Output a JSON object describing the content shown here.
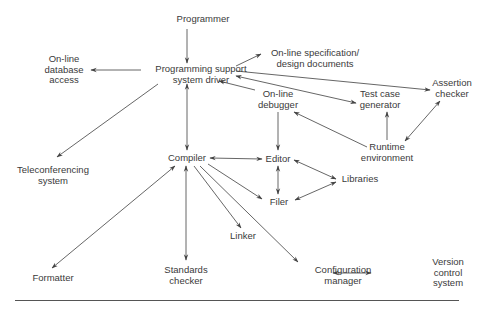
{
  "diagram": {
    "type": "programming-support-environment",
    "nodes": [
      {
        "id": "programmer",
        "label": "Programmer",
        "x": 203,
        "y": 19
      },
      {
        "id": "pssd",
        "label": "Programming support\nsystem driver",
        "x": 201,
        "y": 74
      },
      {
        "id": "db",
        "label": "On-line\ndatabase\naccess",
        "x": 64,
        "y": 70
      },
      {
        "id": "spec",
        "label": "On-line specification/\ndesign documents",
        "x": 315,
        "y": 58
      },
      {
        "id": "debugger",
        "label": "On-line\ndebugger",
        "x": 278,
        "y": 99
      },
      {
        "id": "testgen",
        "label": "Test case\ngenerator",
        "x": 380,
        "y": 99
      },
      {
        "id": "assert",
        "label": "Assertion\nchecker",
        "x": 452,
        "y": 88
      },
      {
        "id": "runtime",
        "label": "Runtime\nenvironment",
        "x": 387,
        "y": 152
      },
      {
        "id": "telecon",
        "label": "Teleconferencing\nsystem",
        "x": 53,
        "y": 175
      },
      {
        "id": "compiler",
        "label": "Compiler",
        "x": 187,
        "y": 158
      },
      {
        "id": "editor",
        "label": "Editor",
        "x": 278,
        "y": 159
      },
      {
        "id": "libraries",
        "label": "Libraries",
        "x": 360,
        "y": 179
      },
      {
        "id": "filer",
        "label": "Filer",
        "x": 279,
        "y": 202
      },
      {
        "id": "linker",
        "label": "Linker",
        "x": 243,
        "y": 236
      },
      {
        "id": "formatter",
        "label": "Formatter",
        "x": 53,
        "y": 278
      },
      {
        "id": "standards",
        "label": "Standards\nchecker",
        "x": 186,
        "y": 275
      },
      {
        "id": "config",
        "label": "Configuration\nmanager",
        "x": 343,
        "y": 275
      },
      {
        "id": "version",
        "label": "Version\ncontrol\nsystem",
        "x": 448,
        "y": 273
      }
    ],
    "edges": [
      {
        "from": "programmer",
        "to": "pssd",
        "dir": "forward",
        "x1": 187,
        "y1": 29,
        "x2": 187,
        "y2": 63
      },
      {
        "from": "pssd",
        "to": "db",
        "dir": "forward",
        "x1": 141,
        "y1": 70,
        "x2": 91,
        "y2": 70
      },
      {
        "from": "pssd",
        "to": "spec",
        "dir": "forward",
        "x1": 236,
        "y1": 66,
        "x2": 261,
        "y2": 54
      },
      {
        "from": "pssd",
        "to": "assert",
        "dir": "forward",
        "x1": 236,
        "y1": 71,
        "x2": 430,
        "y2": 90
      },
      {
        "from": "pssd",
        "to": "testgen",
        "dir": "both",
        "x1": 236,
        "y1": 76,
        "x2": 356,
        "y2": 103
      },
      {
        "from": "debugger",
        "to": "pssd",
        "dir": "forward",
        "x1": 255,
        "y1": 90,
        "x2": 219,
        "y2": 81
      },
      {
        "from": "pssd",
        "to": "telecon",
        "dir": "forward",
        "x1": 158,
        "y1": 84,
        "x2": 57,
        "y2": 157
      },
      {
        "from": "pssd",
        "to": "compiler",
        "dir": "both",
        "x1": 187,
        "y1": 84,
        "x2": 187,
        "y2": 150
      },
      {
        "from": "debugger",
        "to": "editor",
        "dir": "forward",
        "x1": 278,
        "y1": 112,
        "x2": 278,
        "y2": 150
      },
      {
        "from": "runtime",
        "to": "debugger",
        "dir": "forward",
        "x1": 367,
        "y1": 147,
        "x2": 294,
        "y2": 112
      },
      {
        "from": "runtime",
        "to": "testgen",
        "dir": "forward",
        "x1": 387,
        "y1": 140,
        "x2": 387,
        "y2": 112
      },
      {
        "from": "runtime",
        "to": "assert",
        "dir": "both",
        "x1": 405,
        "y1": 141,
        "x2": 440,
        "y2": 101
      },
      {
        "from": "compiler",
        "to": "editor",
        "dir": "both",
        "x1": 210,
        "y1": 158,
        "x2": 262,
        "y2": 159
      },
      {
        "from": "editor",
        "to": "filer",
        "dir": "both",
        "x1": 278,
        "y1": 166,
        "x2": 278,
        "y2": 194
      },
      {
        "from": "editor",
        "to": "libraries",
        "dir": "both",
        "x1": 294,
        "y1": 160,
        "x2": 336,
        "y2": 179
      },
      {
        "from": "filer",
        "to": "libraries",
        "dir": "both",
        "x1": 295,
        "y1": 200,
        "x2": 336,
        "y2": 182
      },
      {
        "from": "compiler",
        "to": "filer",
        "dir": "forward",
        "x1": 208,
        "y1": 164,
        "x2": 262,
        "y2": 199
      },
      {
        "from": "compiler",
        "to": "linker",
        "dir": "forward",
        "x1": 194,
        "y1": 166,
        "x2": 241,
        "y2": 228
      },
      {
        "from": "compiler",
        "to": "config",
        "dir": "forward",
        "x1": 200,
        "y1": 166,
        "x2": 298,
        "y2": 262
      },
      {
        "from": "compiler",
        "to": "formatter",
        "dir": "both",
        "x1": 175,
        "y1": 166,
        "x2": 52,
        "y2": 268
      },
      {
        "from": "compiler",
        "to": "standards",
        "dir": "both",
        "x1": 186,
        "y1": 166,
        "x2": 186,
        "y2": 260
      },
      {
        "from": "config",
        "to": "version",
        "dir": "both",
        "x1": 333,
        "y1": 273,
        "x2": 371,
        "y2": 273
      }
    ]
  }
}
